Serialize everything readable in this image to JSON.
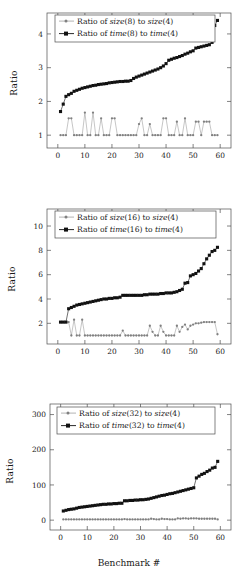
{
  "figure": {
    "xlabel": "Benchmark #",
    "ylabel": "Ratio",
    "panels": [
      "panel1",
      "panel2",
      "panel3"
    ]
  },
  "chart_data": [
    {
      "type": "line",
      "title": "",
      "xlabel": "",
      "ylabel": "Ratio",
      "xlim": [
        -4,
        64
      ],
      "ylim": [
        0.62,
        4.62
      ],
      "xticks": [
        0,
        10,
        20,
        30,
        40,
        50,
        60
      ],
      "yticks": [
        1,
        2,
        3,
        4
      ],
      "grid": false,
      "legend_position": "top-left",
      "legend": [
        "Ratio of size(8) to size(4)",
        "Ratio of time(8) to time(4)"
      ],
      "legend_rich": [
        {
          "pre": "Ratio of ",
          "it1": "size",
          "mid1": "(8) to ",
          "it2": "size",
          "mid2": "(4)"
        },
        {
          "pre": "Ratio of ",
          "it1": "time",
          "mid1": "(8) to ",
          "it2": "time",
          "mid2": "(4)"
        }
      ],
      "x": [
        1,
        2,
        3,
        4,
        5,
        6,
        7,
        8,
        9,
        10,
        11,
        12,
        13,
        14,
        15,
        16,
        17,
        18,
        19,
        20,
        21,
        22,
        23,
        24,
        25,
        26,
        27,
        28,
        29,
        30,
        31,
        32,
        33,
        34,
        35,
        36,
        37,
        38,
        39,
        40,
        41,
        42,
        43,
        44,
        45,
        46,
        47,
        48,
        49,
        50,
        51,
        52,
        53,
        54,
        55,
        56,
        57,
        58,
        59
      ],
      "series": [
        {
          "name": "Ratio of size(8) to size(4)",
          "color": "#808080",
          "marker": "dot",
          "values": [
            1.0,
            1.0,
            1.0,
            1.5,
            1.5,
            1.0,
            1.0,
            1.0,
            1.0,
            1.67,
            1.0,
            1.0,
            1.67,
            1.0,
            1.0,
            1.5,
            1.0,
            1.0,
            1.0,
            1.5,
            1.5,
            1.0,
            1.0,
            1.0,
            1.0,
            1.0,
            1.0,
            1.0,
            1.0,
            1.33,
            1.5,
            1.0,
            1.0,
            1.33,
            1.0,
            1.0,
            1.0,
            1.0,
            1.5,
            1.5,
            1.0,
            1.0,
            1.0,
            1.4,
            1.0,
            1.0,
            1.5,
            1.0,
            1.0,
            1.0,
            1.4,
            1.4,
            1.0,
            1.4,
            1.4,
            1.4,
            1.0,
            1.0,
            1.0
          ]
        },
        {
          "name": "Ratio of time(8) to time(4)",
          "color": "#111111",
          "marker": "square",
          "values": [
            1.7,
            1.92,
            2.15,
            2.2,
            2.24,
            2.3,
            2.33,
            2.36,
            2.39,
            2.41,
            2.43,
            2.45,
            2.47,
            2.48,
            2.5,
            2.51,
            2.52,
            2.53,
            2.55,
            2.56,
            2.57,
            2.58,
            2.59,
            2.59,
            2.6,
            2.6,
            2.62,
            2.68,
            2.72,
            2.75,
            2.78,
            2.81,
            2.84,
            2.87,
            2.9,
            2.93,
            2.96,
            3.0,
            3.05,
            3.12,
            3.22,
            3.25,
            3.28,
            3.3,
            3.33,
            3.36,
            3.4,
            3.43,
            3.47,
            3.5,
            3.58,
            3.6,
            3.62,
            3.64,
            3.66,
            3.68,
            3.75,
            4.25,
            4.4
          ]
        }
      ]
    },
    {
      "type": "line",
      "title": "",
      "xlabel": "",
      "ylabel": "Ratio",
      "xlim": [
        -4,
        64
      ],
      "ylim": [
        0.3,
        11.4
      ],
      "xticks": [
        0,
        10,
        20,
        30,
        40,
        50,
        60
      ],
      "yticks": [
        2,
        4,
        6,
        8,
        10
      ],
      "grid": false,
      "legend_position": "top-left",
      "legend": [
        "Ratio of size(16) to size(4)",
        "Ratio of time(16) to time(4)"
      ],
      "legend_rich": [
        {
          "pre": "Ratio of ",
          "it1": "size",
          "mid1": "(16) to ",
          "it2": "size",
          "mid2": "(4)"
        },
        {
          "pre": "Ratio of ",
          "it1": "time",
          "mid1": "(16) to ",
          "it2": "time",
          "mid2": "(4)"
        }
      ],
      "x": [
        1,
        2,
        3,
        4,
        5,
        6,
        7,
        8,
        9,
        10,
        11,
        12,
        13,
        14,
        15,
        16,
        17,
        18,
        19,
        20,
        21,
        22,
        23,
        24,
        25,
        26,
        27,
        28,
        29,
        30,
        31,
        32,
        33,
        34,
        35,
        36,
        37,
        38,
        39,
        40,
        41,
        42,
        43,
        44,
        45,
        46,
        47,
        48,
        49,
        50,
        51,
        52,
        53,
        54,
        55,
        56,
        57,
        58,
        59
      ],
      "series": [
        {
          "name": "Ratio of size(16) to size(4)",
          "color": "#808080",
          "marker": "dot",
          "values": [
            2.1,
            2.1,
            2.1,
            2.1,
            1.0,
            2.3,
            1.0,
            1.0,
            2.3,
            1.0,
            1.0,
            1.0,
            1.0,
            1.0,
            1.0,
            1.0,
            1.0,
            1.0,
            1.0,
            1.0,
            1.0,
            1.0,
            1.0,
            1.4,
            1.0,
            1.0,
            1.0,
            1.0,
            1.0,
            1.0,
            1.0,
            1.0,
            1.0,
            1.8,
            1.3,
            1.0,
            1.0,
            1.8,
            1.3,
            1.0,
            1.0,
            1.0,
            1.0,
            1.8,
            1.3,
            1.7,
            1.9,
            1.5,
            1.8,
            1.9,
            2.0,
            2.0,
            2.05,
            2.1,
            2.1,
            2.1,
            2.1,
            2.1,
            1.1
          ]
        },
        {
          "name": "Ratio of time(16) to time(4)",
          "color": "#111111",
          "marker": "square",
          "values": [
            2.1,
            2.1,
            2.1,
            3.2,
            3.3,
            3.4,
            3.5,
            3.55,
            3.6,
            3.65,
            3.7,
            3.75,
            3.8,
            3.85,
            3.9,
            3.95,
            4.0,
            4.0,
            4.05,
            4.05,
            4.1,
            4.1,
            4.15,
            4.3,
            4.3,
            4.3,
            4.3,
            4.3,
            4.3,
            4.3,
            4.3,
            4.35,
            4.35,
            4.4,
            4.4,
            4.4,
            4.4,
            4.45,
            4.45,
            4.5,
            4.5,
            4.5,
            4.55,
            4.6,
            4.7,
            4.8,
            5.3,
            5.35,
            5.9,
            6.0,
            6.1,
            6.3,
            6.5,
            6.9,
            7.3,
            7.6,
            7.9,
            8.0,
            8.25
          ]
        }
      ]
    },
    {
      "type": "line",
      "title": "",
      "xlabel": "Benchmark #",
      "ylabel": "Ratio",
      "xlim": [
        -4,
        64
      ],
      "ylim": [
        -28,
        330
      ],
      "xticks": [
        0,
        10,
        20,
        30,
        40,
        50,
        60
      ],
      "yticks": [
        0,
        100,
        200,
        300
      ],
      "grid": false,
      "legend_position": "top-left",
      "legend": [
        "Ratio of size(32) to size(4)",
        "Ratio of time(32) to time(4)"
      ],
      "legend_rich": [
        {
          "pre": "Ratio of ",
          "it1": "size",
          "mid1": "(32) to ",
          "it2": "size",
          "mid2": "(4)"
        },
        {
          "pre": "Ratio of ",
          "it1": "time",
          "mid1": "(32) to ",
          "it2": "time",
          "mid2": "(4)"
        }
      ],
      "x": [
        1,
        2,
        3,
        4,
        5,
        6,
        7,
        8,
        9,
        10,
        11,
        12,
        13,
        14,
        15,
        16,
        17,
        18,
        19,
        20,
        21,
        22,
        23,
        24,
        25,
        26,
        27,
        28,
        29,
        30,
        31,
        32,
        33,
        34,
        35,
        36,
        37,
        38,
        39,
        40,
        41,
        42,
        43,
        44,
        45,
        46,
        47,
        48,
        49,
        50,
        51,
        52,
        53,
        54,
        55,
        56,
        57,
        58,
        59
      ],
      "series": [
        {
          "name": "Ratio of size(32) to size(4)",
          "color": "#808080",
          "marker": "dot",
          "values": [
            2,
            2,
            2,
            2,
            2,
            2,
            2,
            2,
            2,
            2,
            2,
            2,
            2,
            2,
            2,
            2,
            2,
            2,
            2,
            2,
            2,
            2,
            2,
            3,
            2,
            2,
            2,
            2,
            2,
            2,
            2,
            2,
            2,
            4,
            3,
            2,
            2,
            4,
            3,
            3,
            2,
            2,
            2,
            5,
            4,
            5,
            5,
            4,
            5,
            5,
            5,
            4,
            4,
            4,
            4,
            4,
            4,
            4,
            2
          ]
        },
        {
          "name": "Ratio of time(32) to time(4)",
          "color": "#111111",
          "marker": "square",
          "values": [
            26,
            28,
            30,
            31,
            32,
            34,
            36,
            37,
            38,
            39,
            40,
            41,
            42,
            43,
            44,
            45,
            45,
            46,
            46,
            47,
            47,
            48,
            48,
            55,
            55,
            56,
            56,
            57,
            57,
            58,
            58,
            59,
            60,
            62,
            64,
            66,
            68,
            70,
            71,
            73,
            75,
            76,
            78,
            80,
            82,
            84,
            86,
            88,
            90,
            92,
            120,
            125,
            130,
            133,
            138,
            142,
            148,
            150,
            167
          ]
        }
      ]
    }
  ]
}
